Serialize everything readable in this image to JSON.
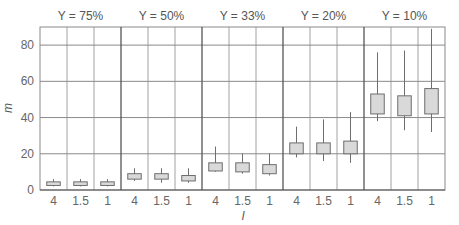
{
  "chart_data": {
    "type": "boxplot",
    "title": "",
    "xlabel": "l",
    "ylabel": "m",
    "ylim": [
      0,
      90
    ],
    "yticks": [
      0,
      20,
      40,
      60,
      80
    ],
    "grid": true,
    "legend": null,
    "panel_variable": "Y",
    "categories": [
      "4",
      "1.5",
      "1"
    ],
    "panels": [
      {
        "label": "Y = 75%",
        "boxes": [
          {
            "l": "4",
            "whisker_low": 2,
            "q1": 2.5,
            "q3": 4.5,
            "whisker_high": 6
          },
          {
            "l": "1.5",
            "whisker_low": 2,
            "q1": 2.5,
            "q3": 4.5,
            "whisker_high": 6
          },
          {
            "l": "1",
            "whisker_low": 2,
            "q1": 2.5,
            "q3": 4.5,
            "whisker_high": 6
          }
        ]
      },
      {
        "label": "Y = 50%",
        "boxes": [
          {
            "l": "4",
            "whisker_low": 5,
            "q1": 6,
            "q3": 9,
            "whisker_high": 12
          },
          {
            "l": "1.5",
            "whisker_low": 4,
            "q1": 6,
            "q3": 9,
            "whisker_high": 12
          },
          {
            "l": "1",
            "whisker_low": 4,
            "q1": 5,
            "q3": 8,
            "whisker_high": 12
          }
        ]
      },
      {
        "label": "Y = 33%",
        "boxes": [
          {
            "l": "4",
            "whisker_low": 10,
            "q1": 10.5,
            "q3": 15,
            "whisker_high": 24
          },
          {
            "l": "1.5",
            "whisker_low": 9,
            "q1": 10,
            "q3": 15,
            "whisker_high": 20
          },
          {
            "l": "1",
            "whisker_low": 8,
            "q1": 9,
            "q3": 14,
            "whisker_high": 20
          }
        ]
      },
      {
        "label": "Y = 20%",
        "boxes": [
          {
            "l": "4",
            "whisker_low": 18,
            "q1": 20,
            "q3": 26,
            "whisker_high": 35
          },
          {
            "l": "1.5",
            "whisker_low": 16,
            "q1": 20,
            "q3": 26,
            "whisker_high": 39
          },
          {
            "l": "1",
            "whisker_low": 15,
            "q1": 20,
            "q3": 27,
            "whisker_high": 43
          }
        ]
      },
      {
        "label": "Y = 10%",
        "boxes": [
          {
            "l": "4",
            "whisker_low": 38,
            "q1": 42,
            "q3": 53,
            "whisker_high": 76
          },
          {
            "l": "1.5",
            "whisker_low": 33,
            "q1": 41,
            "q3": 52,
            "whisker_high": 77
          },
          {
            "l": "1",
            "whisker_low": 32,
            "q1": 42,
            "q3": 56,
            "whisker_high": 89
          }
        ]
      }
    ],
    "colors": {
      "box_fill": "#d9d9d9",
      "box_stroke": "#6e6e6e",
      "grid": "#8a8a8a",
      "panel_divider": "#555555",
      "text": "#666666"
    }
  }
}
